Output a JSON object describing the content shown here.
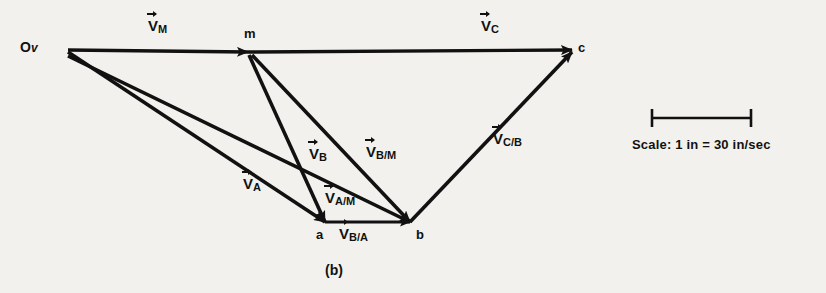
{
  "figure": {
    "caption": "(b)",
    "type": "velocity-polygon-diagram",
    "background_color": "#f2f1ed",
    "ink_color": "#111111"
  },
  "points": [
    {
      "id": "origin",
      "label": "O",
      "sublabel": "v",
      "x": 68,
      "y": 50
    },
    {
      "id": "m",
      "label": "m",
      "x": 248,
      "y": 52
    },
    {
      "id": "c",
      "label": "c",
      "x": 572,
      "y": 50
    },
    {
      "id": "a",
      "label": "a",
      "x": 325,
      "y": 222
    },
    {
      "id": "b",
      "label": "b",
      "x": 410,
      "y": 222
    }
  ],
  "vectors": [
    {
      "id": "VM",
      "symbol": "V",
      "sub": "M",
      "from": "origin",
      "to": "m",
      "label_x": 148,
      "label_y": 20
    },
    {
      "id": "VC",
      "symbol": "V",
      "sub": "C",
      "from": "m",
      "to": "c",
      "label_x": 481,
      "label_y": 20
    },
    {
      "id": "VA",
      "symbol": "V",
      "sub": "A",
      "from": "origin",
      "to": "a",
      "label_x": 245,
      "label_y": 178
    },
    {
      "id": "VB",
      "symbol": "V",
      "sub": "B",
      "from": "origin",
      "to": "b",
      "label_x": 311,
      "label_y": 148
    },
    {
      "id": "VAM",
      "symbol": "V",
      "sub": "A/M",
      "from": "m",
      "to": "a",
      "label_x": 328,
      "label_y": 192
    },
    {
      "id": "VBM",
      "symbol": "V",
      "sub": "B/M",
      "from": "m",
      "to": "b",
      "label_x": 368,
      "label_y": 146
    },
    {
      "id": "VBA",
      "symbol": "V",
      "sub": "B/A",
      "from": "a",
      "to": "b",
      "label_x": 341,
      "label_y": 228
    },
    {
      "id": "VCB",
      "symbol": "V",
      "sub": "C/B",
      "from": "b",
      "to": "c",
      "label_x": 493,
      "label_y": 133
    }
  ],
  "scale": {
    "prefix": "Scale:",
    "value": "1 in = 30 in/sec",
    "full_text": "Scale:  1 in = 30 in/sec",
    "bar": {
      "x1": 651,
      "x2": 752,
      "y": 118
    }
  },
  "labels": {
    "point_origin": "O",
    "point_origin_sub": "v",
    "point_m": "m",
    "point_c": "c",
    "point_a": "a",
    "point_b": "b",
    "vm_symbol": "V",
    "vm_sub": "M",
    "vc_symbol": "V",
    "vc_sub": "C",
    "va_symbol": "V",
    "va_sub": "A",
    "vb_symbol": "V",
    "vb_sub": "B",
    "vam_symbol": "V",
    "vam_sub": "A/M",
    "vbm_symbol": "V",
    "vbm_sub": "B/M",
    "vba_symbol": "V",
    "vba_sub": "B/A",
    "vcb_symbol": "V",
    "vcb_sub": "C/B",
    "caption": "(b)",
    "scale_text": "Scale:  1 in = 30 in/sec"
  }
}
